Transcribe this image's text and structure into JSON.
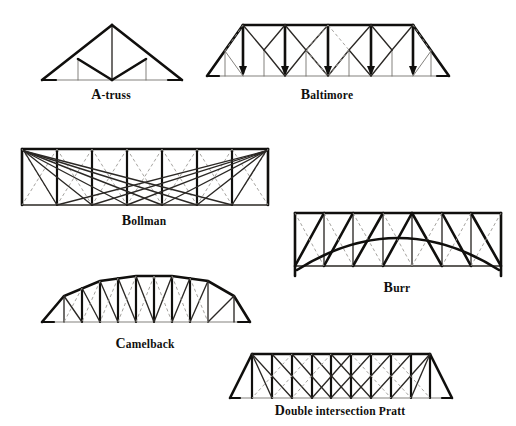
{
  "page": {
    "background_color": "#ffffff",
    "ink_color": "#100f0d",
    "dashed_color": "#9b9894",
    "thin_color": "#6d6a66",
    "width": 516,
    "height": 426
  },
  "figures": [
    {
      "id": "a-truss",
      "caption": "A-truss",
      "caption_initial": "A",
      "caption_rest": "-truss",
      "position": {
        "x": 38,
        "y": 18,
        "w": 146,
        "h": 64
      },
      "caption_position": {
        "x": 38,
        "y": 88,
        "w": 146
      },
      "description": "Triangular A-frame truss with heavy top chords, central vertical and two inner verticals, heavy inverted-V chords meeting at bottom centre."
    },
    {
      "id": "baltimore",
      "caption": "Baltimore",
      "caption_initial": "B",
      "caption_rest": "altimore",
      "position": {
        "x": 203,
        "y": 16,
        "w": 248,
        "h": 66
      },
      "caption_position": {
        "x": 203,
        "y": 88,
        "w": 248
      },
      "description": "Parallel-chord Pratt truss with sub-divided panels, inclined end posts, heavy verticals with arrowheads at panel points and two dashed counter-diagonals near mid-span."
    },
    {
      "id": "bollman",
      "caption": "Bollman",
      "caption_initial": "B",
      "caption_rest": "ollman",
      "position": {
        "x": 18,
        "y": 143,
        "w": 252,
        "h": 66
      },
      "caption_position": {
        "x": 18,
        "y": 214,
        "w": 252
      },
      "description": "Bollman truss: rectangular frame with independent diagonals radiating from each top corner to every bottom panel point, plus faint dashed counter-diagonals in each panel."
    },
    {
      "id": "burr",
      "caption": "Burr",
      "caption_initial": "B",
      "caption_rest": "urr",
      "position": {
        "x": 290,
        "y": 208,
        "w": 214,
        "h": 70
      },
      "caption_position": {
        "x": 290,
        "y": 281,
        "w": 214
      },
      "description": "Burr arch truss: rectangular multiple king-post panel truss overlaid by a heavy segmental timber arch springing from the bottom corners."
    },
    {
      "id": "camelback",
      "caption": "Camelback",
      "caption_initial": "C",
      "caption_rest": "amelback",
      "position": {
        "x": 38,
        "y": 264,
        "w": 214,
        "h": 66
      },
      "caption_position": {
        "x": 38,
        "y": 337,
        "w": 214
      },
      "description": "Camelback truss: polygonal top chord of several straight segments over a flat bottom chord, verticals, heavy diagonals and dashed counter-diagonals."
    },
    {
      "id": "double-intersection-pratt",
      "caption": "Double intersection Pratt",
      "caption_initial": "D",
      "caption_rest": "ouble intersection Pratt",
      "position": {
        "x": 226,
        "y": 348,
        "w": 228,
        "h": 58
      },
      "caption_position": {
        "x": 226,
        "y": 404,
        "w": 228
      },
      "description": "Double intersection (Whipple) Pratt truss: parallel chords, inclined end posts, verticals, and diagonals crossing two panels, with dashed counter-diagonals at centre."
    }
  ]
}
